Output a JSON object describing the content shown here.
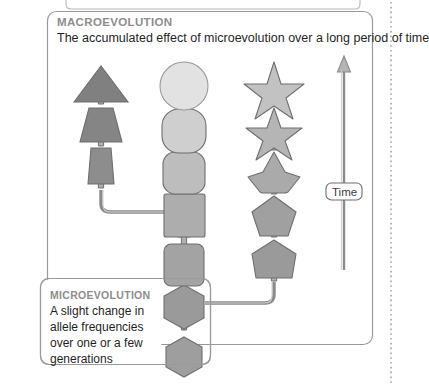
{
  "diagram": {
    "title_visible": false,
    "macro_panel": {
      "heading": "MACROEVOLUTION",
      "description": "The accumulated effect of microevolution over a long period of time",
      "heading_color": "#8d8d8d",
      "description_color": "#1f1f1f",
      "border_color": "#9a9a9a",
      "fill": "#ffffff"
    },
    "micro_panel": {
      "heading": "MICROEVOLUTION",
      "lines": [
        "A slight change in",
        "allele frequencies",
        "over one or a few",
        "generations"
      ],
      "heading_color": "#8d8d8d",
      "text_color": "#1f1f1f",
      "border_color": "#9a9a9a",
      "fill": "#ffffff"
    },
    "time_axis": {
      "label": "Time",
      "direction": "upward",
      "arrow_color": "#8a8a8a",
      "label_border_color": "#6f6f6f",
      "label_text_color": "#3a3a3a"
    },
    "colors": {
      "shape_stroke": "#6f6f6f",
      "arrow_stroke": "#6f6f6f",
      "arrow_fill": "#a8a8a8",
      "connector": "#8a8a8a",
      "dotted_margin": "#9a9a9a",
      "page_background": "#ffffff",
      "darkest_shape": "#808080",
      "lightest_shape": "#e2e2e2"
    },
    "lineages": [
      {
        "name": "triangle-lineage",
        "position": "left",
        "shapes": [
          {
            "id": "left-3",
            "kind": "triangle",
            "fill": "#808080",
            "order": 3
          },
          {
            "id": "left-2",
            "kind": "wide-trapezoid",
            "fill": "#858585",
            "order": 2
          },
          {
            "id": "left-1",
            "kind": "narrow-trapezoid",
            "fill": "#8d8d8d",
            "order": 1
          }
        ]
      },
      {
        "name": "circle-lineage",
        "position": "center",
        "shapes": [
          {
            "id": "mid-7",
            "kind": "circle",
            "fill": "#e2e2e2",
            "order": 7
          },
          {
            "id": "mid-6",
            "kind": "rounded-square-lg",
            "fill": "#cfcfcf",
            "order": 6
          },
          {
            "id": "mid-5",
            "kind": "rounded-square-md",
            "fill": "#bdbdbd",
            "order": 5
          },
          {
            "id": "mid-4",
            "kind": "square",
            "fill": "#adadad",
            "order": 4
          },
          {
            "id": "mid-3",
            "kind": "rounded-square-sm",
            "fill": "#a3a3a3",
            "order": 3
          },
          {
            "id": "mid-2",
            "kind": "hexagon",
            "fill": "#9a9a9a",
            "order": 2
          },
          {
            "id": "mid-1",
            "kind": "hexagon",
            "fill": "#9e9e9e",
            "order": 1
          }
        ]
      },
      {
        "name": "star-lineage",
        "position": "right",
        "shapes": [
          {
            "id": "right-5",
            "kind": "star",
            "fill": "#c2c2c2",
            "order": 5
          },
          {
            "id": "right-4",
            "kind": "star",
            "fill": "#b5b5b5",
            "order": 4
          },
          {
            "id": "right-3",
            "kind": "rounded-star",
            "fill": "#aaaaaa",
            "order": 3
          },
          {
            "id": "right-2",
            "kind": "pentagon",
            "fill": "#a0a0a0",
            "order": 2
          },
          {
            "id": "right-1",
            "kind": "rounded-pentagon",
            "fill": "#9a9a9a",
            "order": 1
          }
        ]
      }
    ],
    "branches": [
      {
        "from": "mid-4",
        "to": "left-1",
        "direction": "left"
      },
      {
        "from": "mid-2",
        "to": "right-1",
        "direction": "right"
      }
    ]
  }
}
